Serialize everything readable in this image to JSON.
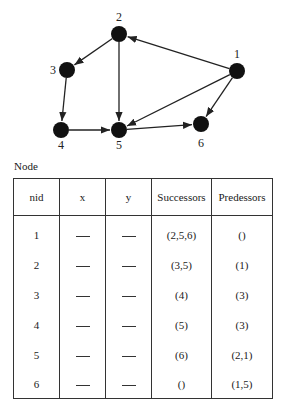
{
  "graph": {
    "nodes": [
      {
        "id": "1",
        "x": 237,
        "y": 71,
        "label_dx": 0,
        "label_dy": -13
      },
      {
        "id": "2",
        "x": 119,
        "y": 34,
        "label_dx": 0,
        "label_dy": -13
      },
      {
        "id": "3",
        "x": 67,
        "y": 70,
        "label_dx": -14,
        "label_dy": 4
      },
      {
        "id": "4",
        "x": 61,
        "y": 130,
        "label_dx": 0,
        "label_dy": 19
      },
      {
        "id": "5",
        "x": 119,
        "y": 130,
        "label_dx": 0,
        "label_dy": 19
      },
      {
        "id": "6",
        "x": 201,
        "y": 124,
        "label_dx": 0,
        "label_dy": 23
      }
    ],
    "edges": [
      {
        "from": "1",
        "to": "2"
      },
      {
        "from": "1",
        "to": "5"
      },
      {
        "from": "1",
        "to": "6"
      },
      {
        "from": "2",
        "to": "3"
      },
      {
        "from": "2",
        "to": "5"
      },
      {
        "from": "3",
        "to": "4"
      },
      {
        "from": "4",
        "to": "5"
      },
      {
        "from": "5",
        "to": "6"
      }
    ],
    "node_color": "#111111",
    "edge_color": "#222222"
  },
  "table": {
    "caption": "Node",
    "headers": [
      "nid",
      "x",
      "y",
      "Successors",
      "Predessors"
    ],
    "rows": [
      {
        "nid": "1",
        "x": "—",
        "y": "—",
        "successors": "(2,5,6)",
        "predecessors": "()"
      },
      {
        "nid": "2",
        "x": "—",
        "y": "—",
        "successors": "(3,5)",
        "predecessors": "(1)"
      },
      {
        "nid": "3",
        "x": "—",
        "y": "—",
        "successors": "(4)",
        "predecessors": "(3)"
      },
      {
        "nid": "4",
        "x": "—",
        "y": "—",
        "successors": "(5)",
        "predecessors": "(3)"
      },
      {
        "nid": "5",
        "x": "—",
        "y": "—",
        "successors": "(6)",
        "predecessors": "(2,1)"
      },
      {
        "nid": "6",
        "x": "—",
        "y": "—",
        "successors": "()",
        "predecessors": "(1,5)"
      }
    ]
  }
}
